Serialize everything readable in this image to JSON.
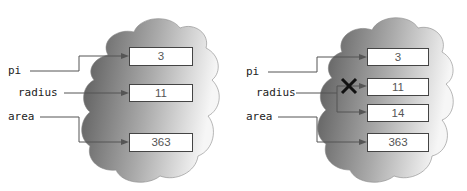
{
  "panels": [
    {
      "name": "before",
      "labels": {
        "pi": "pi",
        "radius": "radius",
        "area": "area"
      },
      "cells": {
        "pi": "3",
        "radius": "11",
        "area": "363"
      }
    },
    {
      "name": "after",
      "labels": {
        "pi": "pi",
        "radius": "radius",
        "area": "area"
      },
      "cells": {
        "pi": "3",
        "radius_old": "11",
        "radius_new": "14",
        "area": "363"
      },
      "crossed_out_marker": "✕"
    }
  ],
  "colors": {
    "cloud_dark": "#5a5a5a",
    "cloud_light": "#f4f4f4",
    "arrow": "#555555",
    "cross": "#111111"
  }
}
